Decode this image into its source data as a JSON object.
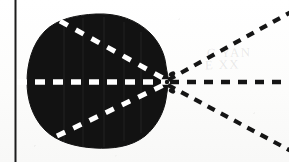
{
  "figure": {
    "caption": "",
    "background_color": "#fbfbfb",
    "ink_color": "#151515",
    "blob_color": "#121212",
    "dash_light_color": "#ffffff",
    "margin_rule": {
      "name": "vertical-margin-rule",
      "x": 15.5,
      "y_top": 0,
      "y_bottom": 162,
      "thickness": 2.0,
      "color": "#1c1c1c"
    },
    "apex": {
      "x": 170,
      "y": 82
    },
    "blob": {
      "label": "",
      "bbox": {
        "x": 27,
        "y": 14,
        "width": 142,
        "height": 134
      },
      "fill": "#121212"
    },
    "rays": [
      {
        "name": "upper-ray",
        "x1": 170,
        "y1": 82,
        "x2": 289,
        "y2": 14,
        "dash": "8 7",
        "width": 4.2,
        "color": "#151515"
      },
      {
        "name": "middle-ray",
        "x1": 170,
        "y1": 82,
        "x2": 289,
        "y2": 82,
        "dash": "9 8",
        "width": 4.6,
        "color": "#151515"
      },
      {
        "name": "lower-ray",
        "x1": 170,
        "y1": 82,
        "x2": 289,
        "y2": 150,
        "dash": "8 7",
        "width": 4.2,
        "color": "#151515"
      }
    ],
    "inner_rays": [
      {
        "name": "inner-upper-ray",
        "x1": 60,
        "y1": 21,
        "x2": 170,
        "y2": 82,
        "dash": "9 9",
        "width": 5.0,
        "color": "#ffffff"
      },
      {
        "name": "inner-middle-ray",
        "x1": 17,
        "y1": 82,
        "x2": 170,
        "y2": 82,
        "dash": "10 8",
        "width": 5.4,
        "color": "#ffffff"
      },
      {
        "name": "inner-lower-ray",
        "x1": 57,
        "y1": 136,
        "x2": 170,
        "y2": 82,
        "dash": "9 9",
        "width": 5.0,
        "color": "#ffffff"
      }
    ],
    "bleed_through_text": [
      {
        "name": "bleed-text-1",
        "text": "C YAN",
        "x": 207,
        "y": 52
      },
      {
        "name": "bleed-text-2",
        "text": "E  XX",
        "x": 205,
        "y": 64
      }
    ]
  }
}
